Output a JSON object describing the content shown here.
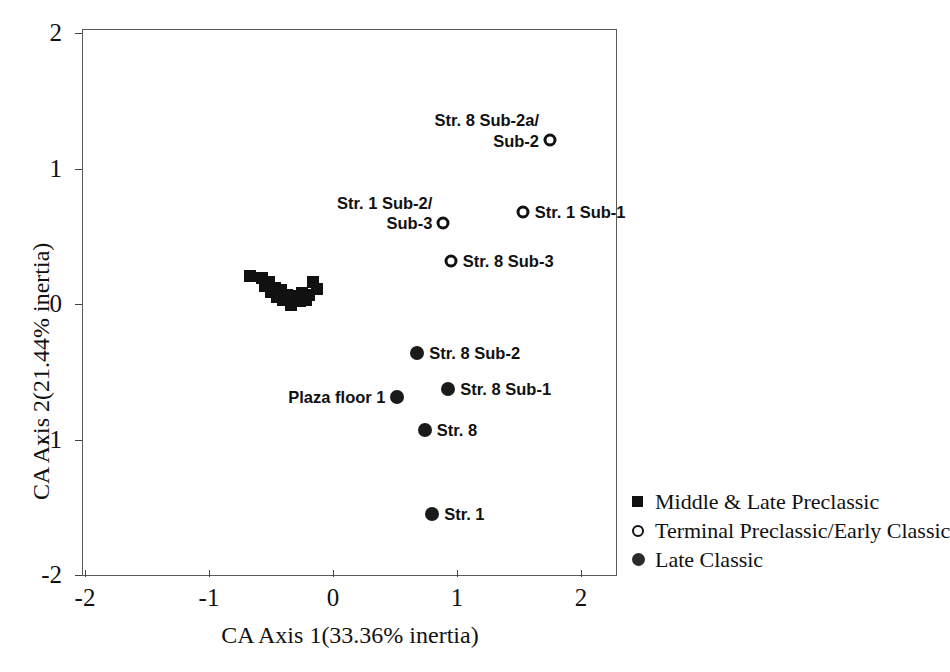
{
  "chart_data": {
    "type": "scatter",
    "title": "",
    "xlabel": "CA Axis 1(33.36% inertia)",
    "ylabel": "CA Axis 2(21.44% inertia)",
    "xlim": [
      -2,
      2
    ],
    "ylim": [
      -2,
      2
    ],
    "xticks": [
      "-2",
      "-1",
      "0",
      "1",
      "2"
    ],
    "yticks": [
      "2",
      "1",
      "0",
      "-1",
      "-2"
    ],
    "xtick_values": [
      -2,
      -1,
      0,
      1,
      2
    ],
    "ytick_values": [
      2,
      1,
      0,
      -1,
      -2
    ],
    "grid": false,
    "legend_position": "outside-right-bottom",
    "series": [
      {
        "name": "Middle & Late Preclassic",
        "marker": "filled-square",
        "color": "#111111",
        "points": [
          {
            "x": -0.67,
            "y": 0.21,
            "label": ""
          },
          {
            "x": -0.57,
            "y": 0.19,
            "label": ""
          },
          {
            "x": -0.55,
            "y": 0.13,
            "label": ""
          },
          {
            "x": -0.52,
            "y": 0.16,
            "label": ""
          },
          {
            "x": -0.5,
            "y": 0.09,
            "label": ""
          },
          {
            "x": -0.47,
            "y": 0.12,
            "label": ""
          },
          {
            "x": -0.45,
            "y": 0.05,
            "label": ""
          },
          {
            "x": -0.42,
            "y": 0.1,
            "label": ""
          },
          {
            "x": -0.4,
            "y": 0.03,
            "label": ""
          },
          {
            "x": -0.37,
            "y": 0.07,
            "label": ""
          },
          {
            "x": -0.34,
            "y": -0.01,
            "label": ""
          },
          {
            "x": -0.29,
            "y": 0.06,
            "label": ""
          },
          {
            "x": -0.27,
            "y": 0.02,
            "label": ""
          },
          {
            "x": -0.25,
            "y": 0.08,
            "label": ""
          },
          {
            "x": -0.22,
            "y": 0.03,
            "label": ""
          },
          {
            "x": -0.19,
            "y": 0.07,
            "label": ""
          },
          {
            "x": -0.16,
            "y": 0.16,
            "label": ""
          },
          {
            "x": -0.13,
            "y": 0.11,
            "label": ""
          }
        ]
      },
      {
        "name": "Terminal Preclassic/Early Classic",
        "marker": "open-circle",
        "color": "#111111",
        "points": [
          {
            "x": 1.75,
            "y": 1.21,
            "label": "Str. 8 Sub-2a/\nSub-2",
            "label_pos": "above-left"
          },
          {
            "x": 1.53,
            "y": 0.68,
            "label": "Str. 1 Sub-1",
            "label_pos": "right"
          },
          {
            "x": 0.89,
            "y": 0.6,
            "label": "Str. 1 Sub-2/\nSub-3",
            "label_pos": "above-left"
          },
          {
            "x": 0.95,
            "y": 0.32,
            "label": "Str. 8 Sub-3",
            "label_pos": "right"
          }
        ]
      },
      {
        "name": "Late Classic",
        "marker": "filled-circle",
        "color": "#1a1a1a",
        "points": [
          {
            "x": 0.68,
            "y": -0.36,
            "label": "Str. 8 Sub-2",
            "label_pos": "right"
          },
          {
            "x": 0.93,
            "y": -0.63,
            "label": "Str. 8 Sub-1",
            "label_pos": "right"
          },
          {
            "x": 0.52,
            "y": -0.69,
            "label": "Plaza floor 1",
            "label_pos": "left"
          },
          {
            "x": 0.74,
            "y": -0.93,
            "label": "Str. 8",
            "label_pos": "right"
          },
          {
            "x": 0.8,
            "y": -1.55,
            "label": "Str. 1",
            "label_pos": "right"
          }
        ]
      }
    ],
    "legend": [
      {
        "label": "Middle & Late Preclassic",
        "marker": "filled-square"
      },
      {
        "label": "Terminal Preclassic/Early Classic",
        "marker": "open-circle"
      },
      {
        "label": "Late Classic",
        "marker": "filled-circle"
      }
    ]
  }
}
